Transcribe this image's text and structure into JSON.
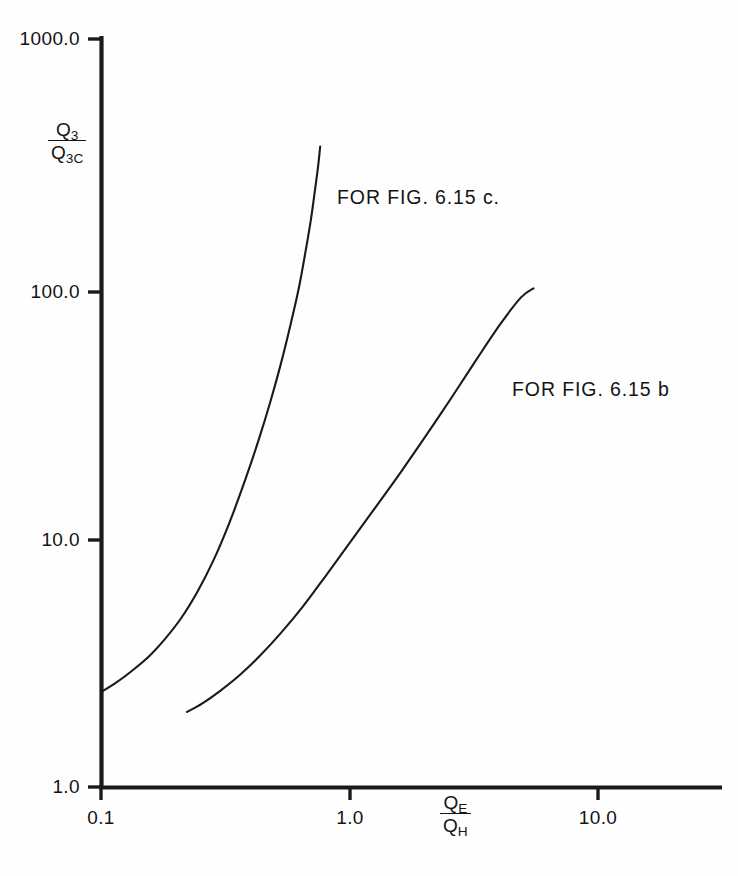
{
  "figure": {
    "background_color": "#ffffff",
    "line_color": "#1a1a1a"
  },
  "chart_data": {
    "type": "line",
    "title": "",
    "subtitle": "",
    "xlabel": "QE/QH",
    "ylabel": "Q3/Q3C",
    "xscale": "log",
    "yscale": "log",
    "xlim": [
      0.1,
      35.0
    ],
    "ylim": [
      1.0,
      1000.0
    ],
    "grid": false,
    "legend_position": "inline-annotation",
    "xticks": [
      0.1,
      1.0,
      10.0
    ],
    "xtick_labels": [
      "0.1",
      "1.0",
      "10.0"
    ],
    "yticks": [
      1.0,
      10.0,
      100.0,
      1000.0
    ],
    "ytick_labels": [
      "1.0",
      "10.0",
      "100.0",
      "1000.0"
    ],
    "series": [
      {
        "name": "FOR FIG. 6.15 c.",
        "label": "FOR FIG. 6.15 c.",
        "x": [
          0.1,
          0.115,
          0.133,
          0.155,
          0.18,
          0.21,
          0.245,
          0.285,
          0.33,
          0.38,
          0.43,
          0.48,
          0.53,
          0.58,
          0.625,
          0.665,
          0.7,
          0.727,
          0.748,
          0.762
        ],
        "y": [
          2.4,
          2.62,
          2.92,
          3.32,
          3.9,
          4.75,
          6.1,
          8.2,
          11.6,
          17.0,
          24.5,
          35.0,
          50.0,
          72.0,
          100.0,
          140.0,
          190.0,
          250.0,
          310.0,
          370.0
        ]
      },
      {
        "name": "FOR FIG. 6.15 b",
        "label": "FOR FIG. 6.15 b",
        "x": [
          0.222,
          0.255,
          0.3,
          0.36,
          0.435,
          0.53,
          0.65,
          0.8,
          1.0,
          1.27,
          1.62,
          2.05,
          2.6,
          3.25,
          4.05,
          4.9,
          5.5
        ],
        "y": [
          2.0,
          2.16,
          2.42,
          2.8,
          3.35,
          4.15,
          5.3,
          7.0,
          9.5,
          13.2,
          18.5,
          26.0,
          37.0,
          52.0,
          72.0,
          92.0,
          100.0
        ]
      }
    ]
  },
  "axes": {
    "y_axis_title": {
      "numerator": "Q",
      "numerator_sub": "3",
      "denominator": "Q",
      "denominator_sub": "3C"
    },
    "x_axis_title": {
      "numerator": "Q",
      "numerator_sub": "E",
      "denominator": "Q",
      "denominator_sub": "H"
    }
  },
  "annotations": [
    {
      "text": "FOR FIG. 6.15 c."
    },
    {
      "text": "FOR FIG. 6.15 b"
    }
  ]
}
